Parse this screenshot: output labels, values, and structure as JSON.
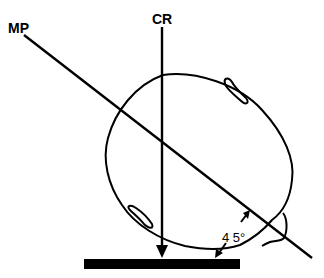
{
  "diagram": {
    "labels": {
      "mp": "MP",
      "cr": "CR",
      "angle": "4 5°"
    },
    "colors": {
      "stroke": "#000000",
      "background": "#ffffff"
    }
  }
}
